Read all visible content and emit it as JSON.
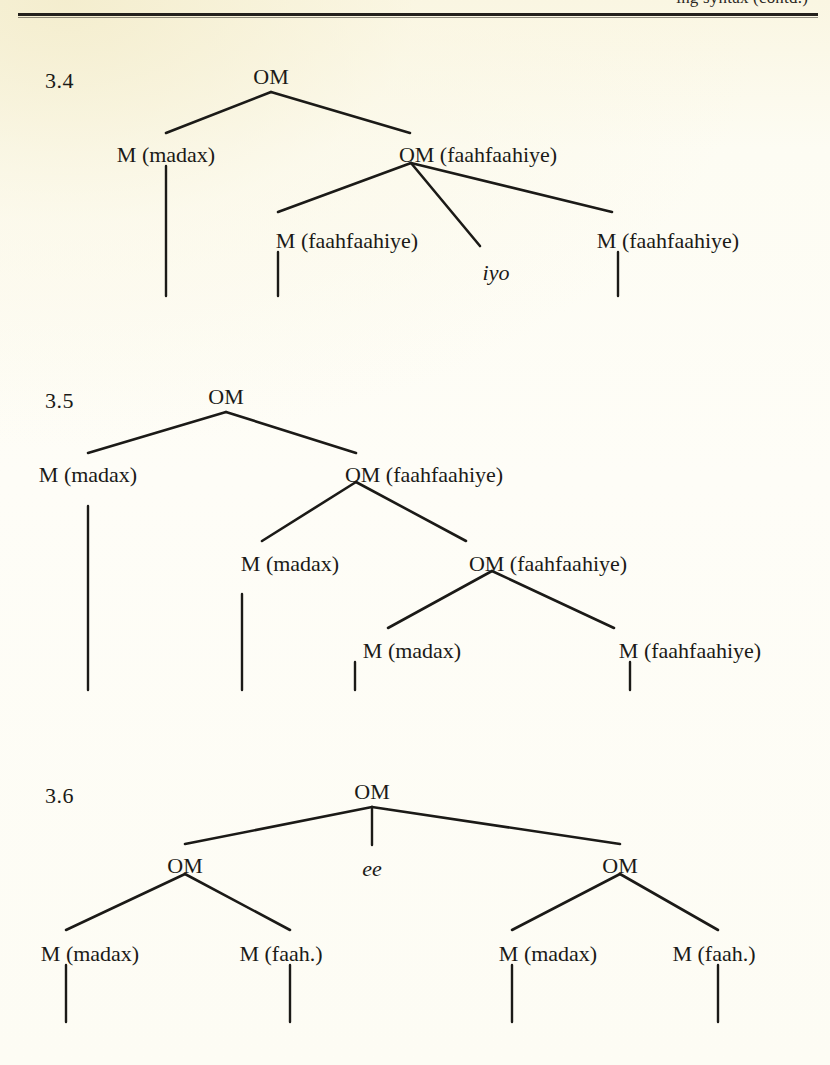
{
  "page": {
    "header_text": "ing syntax (contd.)",
    "background_color": "#fdfcf3",
    "ink_color": "#1b1a17"
  },
  "figures": [
    {
      "label": "3.4",
      "label_pos": {
        "x": 45,
        "y": 68
      },
      "nodes": [
        {
          "id": "root",
          "text": "OM",
          "x": 271,
          "y": 66,
          "italic": false
        },
        {
          "id": "n1",
          "text": "M (madax)",
          "x": 166,
          "y": 144,
          "italic": false
        },
        {
          "id": "n2",
          "text": "OM (faahfaahiye)",
          "x": 478,
          "y": 144,
          "italic": false
        },
        {
          "id": "n3",
          "text": "M (faahfaahiye)",
          "x": 347,
          "y": 230,
          "italic": false
        },
        {
          "id": "n4",
          "text": "iyo",
          "x": 496,
          "y": 262,
          "italic": true
        },
        {
          "id": "n5",
          "text": "M (faahfaahiye)",
          "x": 668,
          "y": 230,
          "italic": false
        }
      ],
      "edges": [
        {
          "from": [
            271,
            92
          ],
          "to": [
            166,
            133
          ]
        },
        {
          "from": [
            271,
            92
          ],
          "to": [
            410,
            133
          ]
        },
        {
          "from": [
            411,
            163
          ],
          "to": [
            278,
            212
          ]
        },
        {
          "from": [
            411,
            163
          ],
          "to": [
            480,
            246
          ]
        },
        {
          "from": [
            411,
            163
          ],
          "to": [
            612,
            212
          ]
        }
      ],
      "drops": [
        {
          "x": 166,
          "y1": 166,
          "y2": 296
        },
        {
          "x": 278,
          "y1": 252,
          "y2": 296
        },
        {
          "x": 618,
          "y1": 252,
          "y2": 296
        }
      ]
    },
    {
      "label": "3.5",
      "label_pos": {
        "x": 45,
        "y": 388
      },
      "nodes": [
        {
          "id": "root",
          "text": "OM",
          "x": 226,
          "y": 386,
          "italic": false
        },
        {
          "id": "n1",
          "text": "M (madax)",
          "x": 88,
          "y": 464,
          "italic": false
        },
        {
          "id": "n2",
          "text": "OM (faahfaahiye)",
          "x": 424,
          "y": 464,
          "italic": false
        },
        {
          "id": "n3",
          "text": "M (madax)",
          "x": 290,
          "y": 553,
          "italic": false
        },
        {
          "id": "n4",
          "text": "OM (faahfaahiye)",
          "x": 548,
          "y": 553,
          "italic": false
        },
        {
          "id": "n5",
          "text": "M (madax)",
          "x": 412,
          "y": 640,
          "italic": false
        },
        {
          "id": "n6",
          "text": "M (faahfaahiye)",
          "x": 690,
          "y": 640,
          "italic": false
        }
      ],
      "edges": [
        {
          "from": [
            226,
            412
          ],
          "to": [
            88,
            453
          ]
        },
        {
          "from": [
            226,
            412
          ],
          "to": [
            356,
            453
          ]
        },
        {
          "from": [
            356,
            482
          ],
          "to": [
            262,
            541
          ]
        },
        {
          "from": [
            356,
            482
          ],
          "to": [
            466,
            541
          ]
        },
        {
          "from": [
            492,
            571
          ],
          "to": [
            388,
            628
          ]
        },
        {
          "from": [
            492,
            571
          ],
          "to": [
            614,
            628
          ]
        }
      ],
      "drops": [
        {
          "x": 88,
          "y1": 506,
          "y2": 690
        },
        {
          "x": 242,
          "y1": 594,
          "y2": 690
        },
        {
          "x": 355,
          "y1": 662,
          "y2": 690
        },
        {
          "x": 630,
          "y1": 662,
          "y2": 690
        }
      ]
    },
    {
      "label": "3.6",
      "label_pos": {
        "x": 45,
        "y": 783
      },
      "nodes": [
        {
          "id": "root",
          "text": "OM",
          "x": 372,
          "y": 781,
          "italic": false
        },
        {
          "id": "n1",
          "text": "OM",
          "x": 185,
          "y": 855,
          "italic": false
        },
        {
          "id": "n2",
          "text": "ee",
          "x": 372,
          "y": 858,
          "italic": true
        },
        {
          "id": "n3",
          "text": "OM",
          "x": 620,
          "y": 855,
          "italic": false
        },
        {
          "id": "n4",
          "text": "M (madax)",
          "x": 90,
          "y": 943,
          "italic": false
        },
        {
          "id": "n5",
          "text": "M (faah.)",
          "x": 281,
          "y": 943,
          "italic": false
        },
        {
          "id": "n6",
          "text": "M (faah.)",
          "x": 714,
          "y": 943,
          "italic": false
        },
        {
          "id": "n7",
          "text": "M (madax)",
          "x": 548,
          "y": 943,
          "italic": false
        }
      ],
      "edges": [
        {
          "from": [
            372,
            807
          ],
          "to": [
            185,
            844
          ]
        },
        {
          "from": [
            372,
            807
          ],
          "to": [
            620,
            844
          ]
        },
        {
          "from": [
            185,
            874
          ],
          "to": [
            66,
            930
          ]
        },
        {
          "from": [
            185,
            874
          ],
          "to": [
            290,
            930
          ]
        },
        {
          "from": [
            620,
            874
          ],
          "to": [
            512,
            930
          ]
        },
        {
          "from": [
            620,
            874
          ],
          "to": [
            718,
            930
          ]
        }
      ],
      "drops": [
        {
          "x": 372,
          "y1": 807,
          "y2": 845
        },
        {
          "x": 66,
          "y1": 965,
          "y2": 1022
        },
        {
          "x": 290,
          "y1": 965,
          "y2": 1022
        },
        {
          "x": 512,
          "y1": 965,
          "y2": 1022
        },
        {
          "x": 718,
          "y1": 965,
          "y2": 1022
        }
      ]
    }
  ]
}
